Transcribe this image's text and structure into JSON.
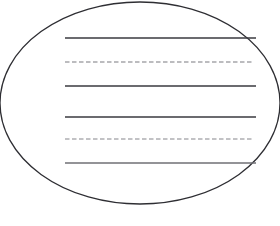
{
  "page": {
    "width": 280,
    "height": 226,
    "background_color": "#ffffff"
  },
  "shapes": {
    "ellipse": {
      "name": "oval-outline",
      "cx": 140,
      "cy": 103,
      "rx": 140,
      "ry": 101,
      "stroke_color": "#2e2e33",
      "stroke_width": 1.3,
      "fill": "none",
      "note": "right side extends past the image edge and is clipped"
    },
    "writing_lines": [
      {
        "id": "line-1",
        "style": "solid",
        "y": 38,
        "x_start": 65,
        "x_end": 256,
        "stroke_color": "#3a3a3f",
        "stroke_width": 1.4,
        "dash_pattern": ""
      },
      {
        "id": "line-2",
        "style": "dashed",
        "y": 62,
        "x_start": 65,
        "x_end": 254,
        "stroke_color": "#7b7b80",
        "stroke_width": 1.1,
        "dash_pattern": "4.5 2.5"
      },
      {
        "id": "line-3",
        "style": "solid",
        "y": 86,
        "x_start": 65,
        "x_end": 256,
        "stroke_color": "#3a3a3f",
        "stroke_width": 1.4,
        "dash_pattern": ""
      },
      {
        "id": "line-4",
        "style": "solid",
        "y": 117,
        "x_start": 65,
        "x_end": 256,
        "stroke_color": "#3a3a3f",
        "stroke_width": 1.4,
        "dash_pattern": ""
      },
      {
        "id": "line-5",
        "style": "dashed",
        "y": 139,
        "x_start": 65,
        "x_end": 254,
        "stroke_color": "#86868b",
        "stroke_width": 1.1,
        "dash_pattern": "4.5 2.5"
      },
      {
        "id": "line-6",
        "style": "solid",
        "y": 163,
        "x_start": 65,
        "x_end": 256,
        "stroke_color": "#6f6f74",
        "stroke_width": 1.5,
        "dash_pattern": ""
      }
    ]
  }
}
